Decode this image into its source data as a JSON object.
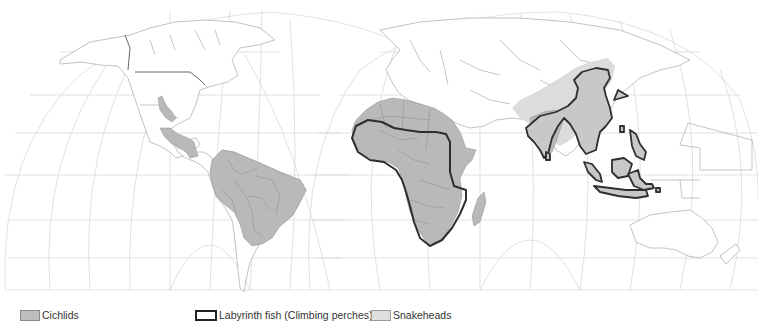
{
  "map": {
    "title": "World distribution of freshwater fish families",
    "projection": "interrupted world projection (two lobes: Americas, Afro-Eurasia/Australia)",
    "colors": {
      "cichlids": "#b9b9b9",
      "labyrinth_outline": "#2e2e2e",
      "snakeheads": "#dcdcdc",
      "graticule": "#d4d4d4",
      "land_outline": "#9a9a9a"
    },
    "regions": [
      {
        "id": "cichlids-americas",
        "label": "Cichlids",
        "area": "Central & South America, southern Texas/Mexico"
      },
      {
        "id": "cichlids-africa",
        "label": "Cichlids",
        "area": "Africa, Madagascar"
      },
      {
        "id": "cichlids-india",
        "label": "Cichlids",
        "area": "Southern India"
      },
      {
        "id": "labyrinth-africa",
        "label": "Labyrinth fish (Climbing perches)",
        "area": "Sub-Saharan Africa"
      },
      {
        "id": "labyrinth-asia",
        "label": "Labyrinth fish (Climbing perches)",
        "area": "South & Southeast Asia, Indonesia"
      },
      {
        "id": "snakeheads",
        "label": "Snakeheads",
        "area": "Africa, South, East & Southeast Asia"
      }
    ]
  },
  "legend": {
    "items": [
      {
        "label": "Cichlids",
        "swatch": "gray-fill"
      },
      {
        "label": "Labyrinth fish (Climbing perches)",
        "swatch": "black-outline"
      },
      {
        "label": "Snakeheads",
        "swatch": "light-gray-fill"
      }
    ]
  }
}
